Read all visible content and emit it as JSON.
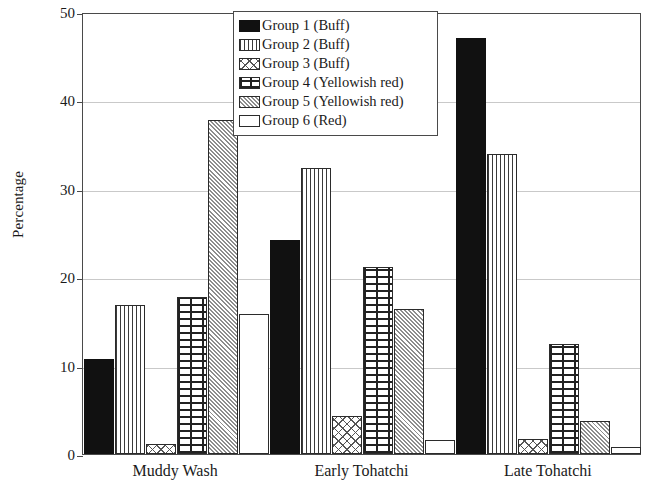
{
  "chart_data": {
    "type": "bar",
    "title": "",
    "xlabel": "",
    "ylabel": "Percentage",
    "ylim": [
      0,
      50
    ],
    "yticks": [
      0,
      10,
      20,
      30,
      40,
      50
    ],
    "grid": true,
    "legend_position": "top-center",
    "categories": [
      "Muddy Wash",
      "Early Tohatchi",
      "Late Tohatchi"
    ],
    "series": [
      {
        "name": "Group 1 (Buff)",
        "pattern": "solid-black",
        "values": [
          10.7,
          24.2,
          47.1
        ]
      },
      {
        "name": "Group 2 (Buff)",
        "pattern": "vertical-lines",
        "values": [
          16.9,
          32.4,
          33.9
        ]
      },
      {
        "name": "Group 3 (Buff)",
        "pattern": "cross-hatch",
        "values": [
          1.1,
          4.3,
          1.7
        ]
      },
      {
        "name": "Group 4 (Yellowish red)",
        "pattern": "brick",
        "values": [
          17.8,
          21.2,
          12.5
        ]
      },
      {
        "name": "Group 5 (Yellowish red)",
        "pattern": "fine-checker",
        "values": [
          37.8,
          16.4,
          3.7
        ]
      },
      {
        "name": "Group 6 (Red)",
        "pattern": "empty-white",
        "values": [
          15.8,
          1.6,
          0.8
        ]
      }
    ]
  },
  "axis": {
    "y_title": "Percentage",
    "y_tick_labels": [
      "0",
      "10",
      "20",
      "30",
      "40",
      "50"
    ],
    "x_tick_labels": [
      "Muddy Wash",
      "Early Tohatchi",
      "Late Tohatchi"
    ]
  },
  "legend": {
    "items": [
      {
        "label": "Group 1 (Buff)"
      },
      {
        "label": "Group 2 (Buff)"
      },
      {
        "label": "Group 3 (Buff)"
      },
      {
        "label": "Group 4 (Yellowish red)"
      },
      {
        "label": "Group 5 (Yellowish red)"
      },
      {
        "label": "Group 6 (Red)"
      }
    ]
  },
  "colors": {
    "axis": "#4a4a4a",
    "grid": "#c9c9c9",
    "bar_outline": "#2b2b2b",
    "solid_fill": "#111111",
    "background": "#ffffff"
  }
}
